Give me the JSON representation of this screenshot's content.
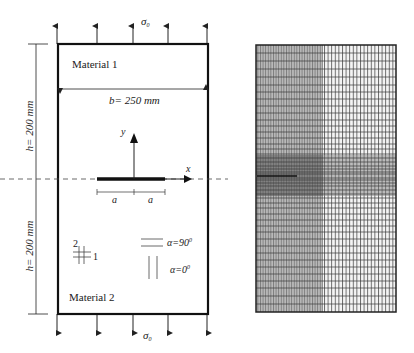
{
  "left_figure": {
    "top_load_label": "σ",
    "top_load_sub": "0",
    "bottom_load_label": "σ",
    "bottom_load_sub": "0",
    "material_top": "Material 1",
    "material_bottom": "Material 2",
    "width_dim": "b= 250 mm",
    "height_dim_top": "h= 200 mm",
    "height_dim_bottom": "h= 200 mm",
    "axis_y": "y",
    "axis_x": "x",
    "crack_half_left": "a",
    "crack_half_right": "a",
    "ortho_axis_2": "2",
    "ortho_axis_1": "1",
    "fiber_90_label": "α=90",
    "fiber_0_label": "α=0",
    "degree": "0"
  },
  "right_figure": {
    "description": "finite element mesh",
    "colors": {
      "line": "#333333",
      "dense_fill": "#9a9a9a",
      "band_fill": "#6a6a6a"
    }
  }
}
